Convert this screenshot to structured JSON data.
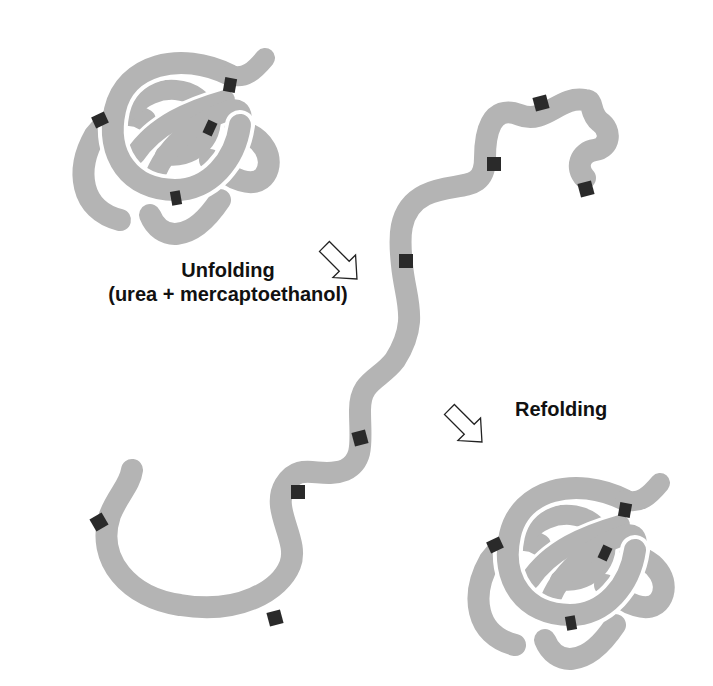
{
  "diagram": {
    "labels": {
      "unfolding_line1": "Unfolding",
      "unfolding_line2": "(urea + mercaptoethanol)",
      "refolding": "Refolding"
    },
    "states": [
      {
        "name": "native-folded-protein",
        "position": "top-left",
        "disulfide_markers": 4
      },
      {
        "name": "unfolded-polypeptide-chain",
        "position": "center",
        "disulfide_markers": 8
      },
      {
        "name": "refolded-native-protein",
        "position": "bottom-right",
        "disulfide_markers": 4
      }
    ],
    "arrows": [
      {
        "name": "unfolding-arrow",
        "direction": "down-right"
      },
      {
        "name": "refolding-arrow",
        "direction": "down-right"
      }
    ],
    "colors": {
      "chain": "#b4b4b4",
      "disulfide_marker": "#2a2a2a",
      "background": "#ffffff",
      "text": "#111111"
    }
  }
}
